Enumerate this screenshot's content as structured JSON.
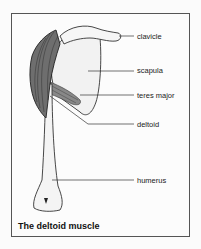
{
  "figure": {
    "title": "The deltoid muscle",
    "labels": [
      {
        "id": "clavicle",
        "text": "clavicle",
        "y": 32
      },
      {
        "id": "scapula",
        "text": "scapula",
        "y": 66
      },
      {
        "id": "teres-major",
        "text": "teres major",
        "y": 91
      },
      {
        "id": "deltoid",
        "text": "deltoid",
        "y": 120
      },
      {
        "id": "humerus",
        "text": "humerus",
        "y": 176
      }
    ]
  }
}
